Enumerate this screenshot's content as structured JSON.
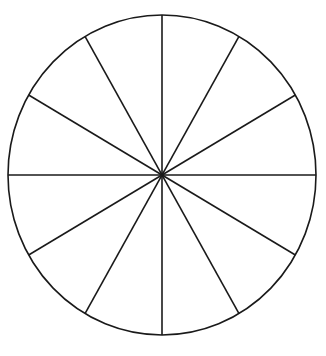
{
  "diagram": {
    "type": "divided-circle",
    "segments": 12,
    "center": [
      162,
      175
    ],
    "rx": 154,
    "ry": 160,
    "stroke_color": "#1a1a1a",
    "background": "#ffffff"
  }
}
